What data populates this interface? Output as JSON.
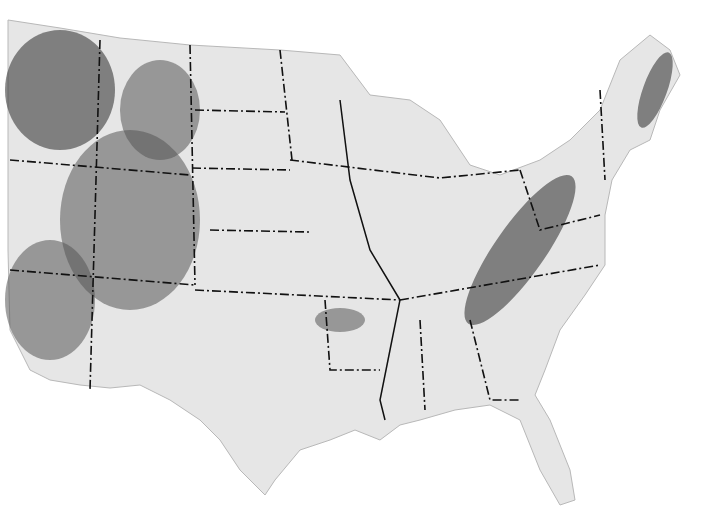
{
  "map": {
    "title": "",
    "style": "grayscale shaded relief",
    "subject": "contiguous United States",
    "features": [
      "state boundaries (dash-dot lines)",
      "Rocky Mountains relief",
      "Appalachian Mountains relief",
      "Ozark relief"
    ],
    "colors": {
      "land": "#e6e6e6",
      "background": "#ffffff",
      "border": "#111111",
      "relief": "#444444"
    }
  }
}
